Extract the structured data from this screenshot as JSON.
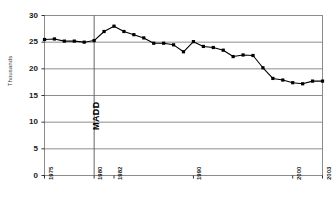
{
  "chart_data": {
    "type": "line",
    "title": "",
    "xlabel": "",
    "ylabel": "Thousands",
    "ylim": [
      0,
      30
    ],
    "xlim": [
      1975,
      2003
    ],
    "yticks": [
      30,
      25,
      20,
      15,
      10,
      5,
      0
    ],
    "xticks": [
      "1975",
      "1980",
      "1982",
      "1990",
      "2000",
      "2003"
    ],
    "xtick_values": [
      1975,
      1980,
      1982,
      1990,
      2000,
      2003
    ],
    "grid": "horizontal",
    "legend": "none",
    "marker": "square",
    "line_color": "#000000",
    "grid_color": "#808080",
    "annotations": [
      {
        "label": "MADD",
        "x": 1980,
        "type": "vertical-line"
      }
    ],
    "x": [
      1975,
      1976,
      1977,
      1978,
      1979,
      1980,
      1981,
      1982,
      1983,
      1984,
      1985,
      1986,
      1987,
      1988,
      1989,
      1990,
      1991,
      1992,
      1993,
      1994,
      1995,
      1996,
      1997,
      1998,
      1999,
      2000,
      2001,
      2002,
      2003
    ],
    "values": [
      25.5,
      25.6,
      25.2,
      25.2,
      25.0,
      25.3,
      27.0,
      28.0,
      27.0,
      26.4,
      25.8,
      24.8,
      24.8,
      24.5,
      23.2,
      25.1,
      24.2,
      24.0,
      23.5,
      22.3,
      22.6,
      22.5,
      20.2,
      18.2,
      17.9,
      17.4,
      17.2,
      17.7,
      17.7
    ]
  },
  "series_extra": {
    "tail_x": [
      1996,
      1997,
      1998,
      1999,
      2000,
      2001,
      2002,
      2003
    ],
    "note": ""
  }
}
